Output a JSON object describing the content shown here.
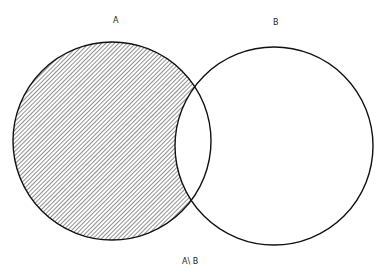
{
  "diagram": {
    "type": "venn",
    "sets": [
      {
        "label": "A",
        "cx": 112,
        "cy": 141,
        "r": 99,
        "shaded": true
      },
      {
        "label": "B",
        "cx": 274,
        "cy": 146,
        "r": 99,
        "shaded": false
      }
    ],
    "caption": "A\\ B",
    "colors": {
      "stroke": "#111111",
      "hatch": "#555555",
      "background": "#ffffff"
    }
  }
}
